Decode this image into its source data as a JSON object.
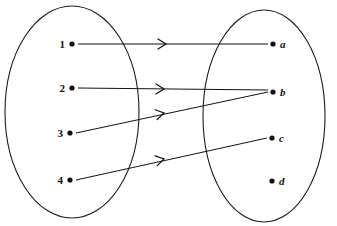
{
  "figure": {
    "type": "set-mapping-diagram",
    "background_color": "#ffffff",
    "stroke_color": "#111111",
    "width": 337,
    "height": 226
  },
  "domain_set": {
    "name": "domain-oval",
    "center_x": 72,
    "center_y": 112,
    "radius_x": 67,
    "radius_y": 106,
    "elements": [
      {
        "label": "1",
        "x": 72,
        "y": 44
      },
      {
        "label": "2",
        "x": 72,
        "y": 88
      },
      {
        "label": "3",
        "x": 70,
        "y": 133
      },
      {
        "label": "4",
        "x": 70,
        "y": 180
      }
    ]
  },
  "codomain_set": {
    "name": "codomain-oval",
    "center_x": 264,
    "center_y": 116,
    "radius_x": 61,
    "radius_y": 106,
    "elements": [
      {
        "label": "a",
        "x": 273,
        "y": 44
      },
      {
        "label": "b",
        "x": 273,
        "y": 92
      },
      {
        "label": "c",
        "x": 272,
        "y": 138
      },
      {
        "label": "d",
        "x": 272,
        "y": 181
      }
    ]
  },
  "mappings": [
    {
      "name": "arrow-1-to-a",
      "from": "1",
      "to": "a",
      "x1": 78,
      "y1": 44,
      "x2": 268,
      "y2": 44,
      "head_x": 166,
      "head_y": 44
    },
    {
      "name": "arrow-2-to-b",
      "from": "2",
      "to": "b",
      "x1": 78,
      "y1": 88,
      "x2": 268,
      "y2": 90,
      "head_x": 164,
      "head_y": 89
    },
    {
      "name": "arrow-3-to-b",
      "from": "3",
      "to": "b",
      "x1": 76,
      "y1": 133,
      "x2": 268,
      "y2": 92,
      "head_x": 164,
      "head_y": 113
    },
    {
      "name": "arrow-4-to-c",
      "from": "4",
      "to": "c",
      "x1": 76,
      "y1": 180,
      "x2": 267,
      "y2": 138,
      "head_x": 164,
      "head_y": 159
    }
  ],
  "unmapped_elements": [
    "d"
  ]
}
